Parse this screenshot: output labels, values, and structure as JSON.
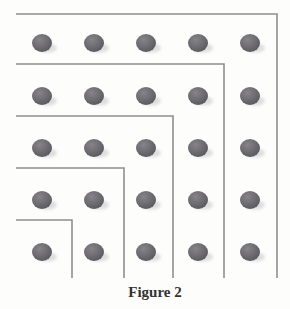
{
  "figure": {
    "caption": "Figure 2",
    "colors": {
      "background": "#fdfdfc",
      "line": "#8f8f8d",
      "dot_highlight": "#868389",
      "dot_mid": "#6d6c71",
      "dot_edge": "#57565c",
      "shadow": "#c3c3c5",
      "caption": "#333333"
    },
    "line_width": 1.6,
    "grid": {
      "rows": 5,
      "cols": 5,
      "dot_count": 25,
      "col_x": [
        42,
        94,
        146,
        198,
        250
      ],
      "row_y": [
        43,
        96,
        148,
        200,
        252
      ],
      "dot_rx": 10,
      "dot_ry": 9,
      "shadow_dx": 5,
      "shadow_dy": 5,
      "shadow_rx": 10,
      "shadow_ry": 4.5
    },
    "gnomon_lines": [
      {
        "points": [
          [
            16,
            14
          ],
          [
            277,
            14
          ],
          [
            277,
            278
          ]
        ]
      },
      {
        "points": [
          [
            16,
            64
          ],
          [
            224,
            64
          ],
          [
            224,
            278
          ]
        ]
      },
      {
        "points": [
          [
            16,
            116
          ],
          [
            173,
            116
          ],
          [
            173,
            278
          ]
        ]
      },
      {
        "points": [
          [
            16,
            168
          ],
          [
            124,
            168
          ],
          [
            124,
            278
          ]
        ]
      },
      {
        "points": [
          [
            16,
            220
          ],
          [
            72,
            220
          ],
          [
            72,
            278
          ]
        ]
      }
    ],
    "caption_pos": {
      "x": 155,
      "y": 297
    }
  }
}
